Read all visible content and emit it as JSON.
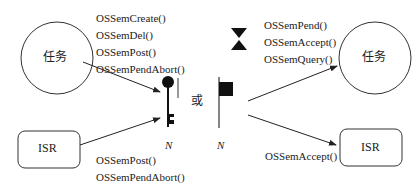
{
  "left": {
    "task_label": "任务",
    "isr_label": "ISR",
    "task_calls": [
      "OSSemCreate()",
      "OSSemDel()",
      "OSSemPost()",
      "OSSemPendAbort()"
    ],
    "isr_calls": [
      "OSSemPost()",
      "OSSemPendAbort()"
    ]
  },
  "center": {
    "or_label": "或",
    "key_count_label": "N",
    "flag_count_label": "N"
  },
  "right": {
    "task_label": "任务",
    "isr_label": "ISR",
    "task_calls": [
      "OSSemPend()",
      "OSSemAccept()",
      "OSSemQuery()"
    ],
    "isr_calls": [
      "OSSemAccept()"
    ]
  }
}
